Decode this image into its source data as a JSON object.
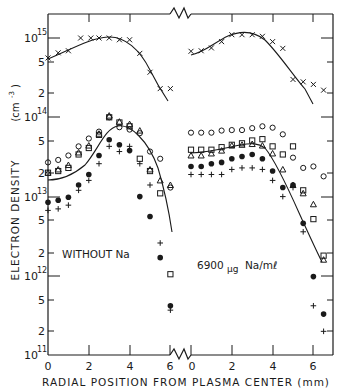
{
  "chart_data": {
    "type": "scatter",
    "title": "",
    "xlabel": "RADIAL POSITION FROM PLASMA CENTER (mm)",
    "ylabel": "ELECTRON DENSITY",
    "ylabel_units": "(cm⁻³)",
    "yscale": "log",
    "ylim": [
      100000000000.0,
      3000000000000000.0
    ],
    "y_ticks_major": [
      "10^11",
      "10^12",
      "10^13",
      "10^14",
      "10^15"
    ],
    "y_ticks_minor_labels": [
      "2",
      "5"
    ],
    "x_ticks": [
      0,
      2,
      4,
      6
    ],
    "xlim_per_panel": [
      0,
      6.5
    ],
    "grid": false,
    "legend": "none (marker types: x, open circle, open square, open triangle, filled circle, plus)",
    "panels": [
      {
        "name": "left",
        "annotation": "WITHOUT Na",
        "series": [
          {
            "name": "x-marker",
            "marker": "x",
            "x": [
              0.0,
              0.5,
              1.0,
              1.6,
              2.1,
              2.5,
              3.0,
              3.5,
              4.0,
              4.5,
              5.0,
              5.5,
              6.0
            ],
            "y": [
              560000000000000.0,
              650000000000000.0,
              690000000000000.0,
              1000000000000000.0,
              1000000000000000.0,
              1000000000000000.0,
              1000000000000000.0,
              950000000000000.0,
              950000000000000.0,
              640000000000000.0,
              370000000000000.0,
              230000000000000.0,
              230000000000000.0
            ]
          },
          {
            "name": "open-circle",
            "marker": "o",
            "x": [
              0.0,
              0.5,
              1.0,
              1.5,
              2.0,
              2.5,
              3.0,
              3.5,
              4.0,
              4.5,
              5.0,
              5.5,
              6.0
            ],
            "y": [
              27000000000000.0,
              29000000000000.0,
              33000000000000.0,
              43000000000000.0,
              54000000000000.0,
              66000000000000.0,
              100000000000000.0,
              75000000000000.0,
              70000000000000.0,
              63000000000000.0,
              37000000000000.0,
              30000000000000.0,
              13000000000000.0
            ]
          },
          {
            "name": "open-square",
            "marker": "square",
            "x": [
              0.0,
              0.5,
              1.0,
              1.5,
              2.0,
              2.5,
              3.0,
              3.5,
              4.0,
              4.5,
              5.0,
              5.5,
              6.0
            ],
            "y": [
              20000000000000.0,
              21000000000000.0,
              23000000000000.0,
              34000000000000.0,
              41000000000000.0,
              60000000000000.0,
              100000000000000.0,
              86000000000000.0,
              77000000000000.0,
              30000000000000.0,
              21000000000000.0,
              11000000000000.0,
              1050000000000.0
            ]
          },
          {
            "name": "open-triangle",
            "marker": "triangle",
            "x": [
              0.0,
              0.5,
              1.0,
              1.5,
              2.0,
              2.5,
              3.0,
              3.5,
              4.0,
              4.5,
              5.0,
              5.5,
              6.0
            ],
            "y": [
              20000000000000.0,
              22000000000000.0,
              25000000000000.0,
              36000000000000.0,
              44000000000000.0,
              62000000000000.0,
              105000000000000.0,
              88000000000000.0,
              82000000000000.0,
              68000000000000.0,
              22000000000000.0,
              16000000000000.0,
              14000000000000.0
            ]
          },
          {
            "name": "filled-circle",
            "marker": "dot",
            "x": [
              0.0,
              0.5,
              1.0,
              1.5,
              2.0,
              2.5,
              3.0,
              3.5,
              4.0,
              4.5,
              5.0,
              5.5,
              6.0
            ],
            "y": [
              8500000000000.0,
              9000000000000.0,
              9800000000000.0,
              14000000000000.0,
              19000000000000.0,
              33000000000000.0,
              52000000000000.0,
              45000000000000.0,
              38000000000000.0,
              10000000000000.0,
              5600000000000.0,
              1700000000000.0,
              420000000000.0
            ]
          },
          {
            "name": "plus",
            "marker": "plus",
            "x": [
              0.0,
              0.5,
              1.0,
              1.5,
              2.0,
              2.5,
              3.0,
              3.5,
              4.0,
              4.5,
              5.0,
              5.5,
              6.0
            ],
            "y": [
              6700000000000.0,
              7000000000000.0,
              7800000000000.0,
              12000000000000.0,
              16000000000000.0,
              26000000000000.0,
              43000000000000.0,
              37000000000000.0,
              43000000000000.0,
              26000000000000.0,
              14000000000000.0,
              2600000000000.0,
              370000000000.0
            ]
          }
        ],
        "fit_curves": [
          {
            "name": "upper-fit",
            "x": [
              0,
              1,
              2,
              3,
              4,
              5,
              5.8
            ],
            "y": [
              550000000000000.0,
              750000000000000.0,
              960000000000000.0,
              1030000000000000.0,
              850000000000000.0,
              400000000000000.0,
              180000000000000.0
            ]
          },
          {
            "name": "lower-fit",
            "x": [
              0,
              1,
              1.8,
              2.5,
              3.2,
              4,
              5,
              5.5,
              6.2
            ],
            "y": [
              16000000000000.0,
              19000000000000.0,
              26000000000000.0,
              48000000000000.0,
              69000000000000.0,
              60000000000000.0,
              28000000000000.0,
              14000000000000.0,
              2400000000000.0
            ]
          }
        ]
      },
      {
        "name": "right",
        "annotation": "6900μg Na/mℓ",
        "series": [
          {
            "name": "x-marker",
            "marker": "x",
            "x": [
              0.0,
              0.5,
              1.0,
              1.5,
              2.0,
              2.5,
              3.0,
              3.5,
              4.0,
              4.5,
              5.0,
              5.5,
              6.0,
              6.5
            ],
            "y": [
              680000000000000.0,
              690000000000000.0,
              750000000000000.0,
              900000000000000.0,
              1100000000000000.0,
              1100000000000000.0,
              1100000000000000.0,
              1050000000000000.0,
              900000000000000.0,
              740000000000000.0,
              300000000000000.0,
              280000000000000.0,
              260000000000000.0,
              220000000000000.0
            ]
          },
          {
            "name": "open-circle",
            "marker": "o",
            "x": [
              0.0,
              0.5,
              1.0,
              1.5,
              2.0,
              2.5,
              3.0,
              3.5,
              4.0,
              4.5,
              5.0,
              5.5,
              6.0,
              6.5
            ],
            "y": [
              64000000000000.0,
              64000000000000.0,
              64000000000000.0,
              68000000000000.0,
              69000000000000.0,
              69000000000000.0,
              73000000000000.0,
              77000000000000.0,
              74000000000000.0,
              61000000000000.0,
              31000000000000.0,
              23000000000000.0,
              24000000000000.0,
              18000000000000.0
            ]
          },
          {
            "name": "open-square",
            "marker": "square",
            "x": [
              0.0,
              0.5,
              1.0,
              1.5,
              2.0,
              2.5,
              3.0,
              3.5,
              4.0,
              4.5,
              5.0,
              5.5,
              6.0,
              6.5
            ],
            "y": [
              39000000000000.0,
              39000000000000.0,
              39000000000000.0,
              42000000000000.0,
              45000000000000.0,
              47000000000000.0,
              51000000000000.0,
              53000000000000.0,
              43000000000000.0,
              34000000000000.0,
              43000000000000.0,
              12000000000000.0,
              5200000000000.0,
              1800000000000.0
            ]
          },
          {
            "name": "open-triangle",
            "marker": "triangle",
            "x": [
              0.0,
              0.5,
              1.0,
              1.5,
              2.0,
              2.5,
              3.0,
              3.5,
              4.0,
              4.5,
              5.0,
              5.5,
              6.0,
              6.5
            ],
            "y": [
              33000000000000.0,
              33000000000000.0,
              35000000000000.0,
              38000000000000.0,
              44000000000000.0,
              45000000000000.0,
              46000000000000.0,
              44000000000000.0,
              35000000000000.0,
              22000000000000.0,
              14000000000000.0,
              11000000000000.0,
              8000000000000.0,
              1600000000000.0
            ]
          },
          {
            "name": "filled-circle",
            "marker": "dot",
            "x": [
              0.0,
              0.5,
              1.0,
              1.5,
              2.0,
              2.5,
              3.0,
              3.5,
              4.0,
              4.5,
              5.0,
              5.5,
              6.0,
              6.5
            ],
            "y": [
              24000000000000.0,
              24000000000000.0,
              26000000000000.0,
              27000000000000.0,
              30000000000000.0,
              32000000000000.0,
              34000000000000.0,
              30000000000000.0,
              21000000000000.0,
              13000000000000.0,
              14000000000000.0,
              4600000000000.0,
              980000000000.0,
              330000000000.0
            ]
          },
          {
            "name": "plus",
            "marker": "plus",
            "x": [
              0.0,
              0.5,
              1.0,
              1.5,
              2.0,
              2.5,
              3.0,
              3.5,
              4.0,
              4.5,
              5.0,
              5.5,
              6.0,
              6.5
            ],
            "y": [
              19000000000000.0,
              19000000000000.0,
              19000000000000.0,
              19000000000000.0,
              22000000000000.0,
              23000000000000.0,
              23000000000000.0,
              22000000000000.0,
              16000000000000.0,
              10000000000000.0,
              13000000000000.0,
              3600000000000.0,
              420000000000.0,
              200000000000.0
            ]
          }
        ],
        "fit_curves": [
          {
            "name": "upper-fit",
            "x": [
              0,
              1,
              2,
              3,
              4,
              5,
              6,
              6.5
            ],
            "y": [
              650000000000000.0,
              730000000000000.0,
              1000000000000000.0,
              1100000000000000.0,
              900000000000000.0,
              450000000000000.0,
              190000000000000.0,
              130000000000000.0
            ]
          },
          {
            "name": "lower-fit",
            "x": [
              0,
              1,
              2,
              3,
              3.5,
              4.2,
              5,
              6,
              6.6
            ],
            "y": [
              35000000000000.0,
              37000000000000.0,
              42000000000000.0,
              48000000000000.0,
              48000000000000.0,
              36000000000000.0,
              15000000000000.0,
              4000000000000.0,
              1500000000000.0
            ]
          }
        ]
      }
    ]
  },
  "labels": {
    "ylabel": "ELECTRON DENSITY",
    "yunits": "(cm",
    "yunits_exp": "-3",
    "xlabel": "RADIAL POSITION FROM PLASMA CENTER (mm)",
    "left_annotation": "WITHOUT Na",
    "right_annotation_num": "6900",
    "right_annotation_unit": "μg",
    "right_annotation_rest": "Na/mℓ",
    "y_tick_major": [
      "10",
      "10",
      "10",
      "10",
      "10"
    ],
    "y_tick_exp": [
      "15",
      "14",
      "13",
      "12",
      "11"
    ],
    "y_minor": [
      "5",
      "2",
      "5",
      "2",
      "5",
      "2",
      "5",
      "2"
    ],
    "x_ticks_left": [
      "0",
      "2",
      "4",
      "6"
    ],
    "x_ticks_right": [
      "0",
      "2",
      "4",
      "6"
    ]
  }
}
